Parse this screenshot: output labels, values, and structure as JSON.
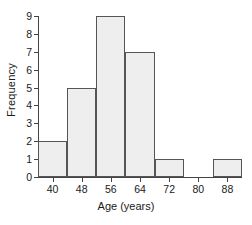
{
  "chart_data": {
    "type": "bar",
    "title": "",
    "xlabel": "Age (years)",
    "ylabel": "Frequency",
    "bin_width": 8,
    "bin_edges": [
      36,
      44,
      52,
      60,
      68,
      76,
      84,
      92
    ],
    "categories": [
      "36-44",
      "44-52",
      "52-60",
      "60-68",
      "68-76",
      "76-84",
      "84-92"
    ],
    "values": [
      2,
      5,
      9,
      7,
      1,
      0,
      1
    ],
    "x_tick_labels": [
      "40",
      "48",
      "56",
      "64",
      "72",
      "80",
      "88"
    ],
    "x_tick_values": [
      40,
      48,
      56,
      64,
      72,
      80,
      88
    ],
    "y_tick_labels": [
      "0",
      "1",
      "2",
      "3",
      "4",
      "5",
      "6",
      "7",
      "8",
      "9"
    ],
    "y_tick_values": [
      0,
      1,
      2,
      3,
      4,
      5,
      6,
      7,
      8,
      9
    ],
    "xlim": [
      36,
      92
    ],
    "ylim": [
      0,
      9
    ],
    "grid": false,
    "legend": false,
    "bar_fill_color": "#eeeeee",
    "bar_edge_color": "#555555",
    "axis_color": "#444444"
  }
}
